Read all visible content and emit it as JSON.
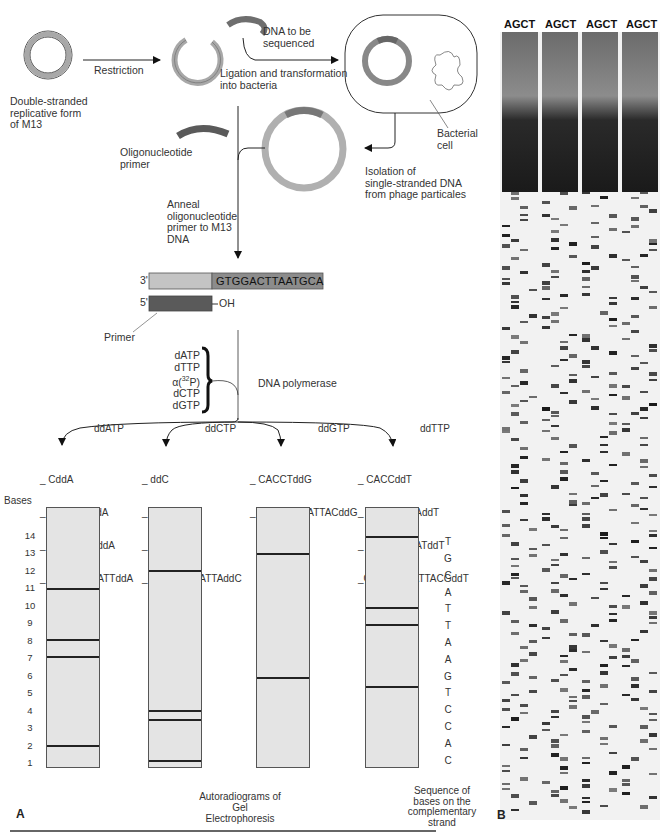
{
  "panel_a": {
    "label": "A",
    "step1": {
      "circle_label": "Double-stranded replicative form of M13",
      "circle_label_lines": [
        "Double-stranded",
        "replicative form",
        "of M13"
      ],
      "arrow_label": "Restriction"
    },
    "insert": {
      "label_lines": [
        "DNA to be",
        "sequenced"
      ]
    },
    "ligation": {
      "label_lines": [
        "Ligation and transformation",
        "into bacteria"
      ]
    },
    "bacterial_cell": {
      "label_lines": [
        "Bacterial",
        "cell"
      ]
    },
    "isolation": {
      "label_lines": [
        "Isolation of",
        "single-stranded DNA",
        "from phage particales"
      ]
    },
    "primer": {
      "label_lines": [
        "Oligonucleotide",
        "primer"
      ]
    },
    "anneal": {
      "label_lines": [
        "Anneal",
        "oligonucleotide",
        "primer to M13",
        "DNA"
      ]
    },
    "template": {
      "end_3": "3'",
      "end_5": "5'",
      "sequence": "GTGGACTTAATGCA",
      "oh": "OH",
      "primer_label": "Primer"
    },
    "reaction": {
      "nucleotides": [
        "dATP",
        "dTTP",
        "dCTP",
        "dGTP"
      ],
      "label_prefix": "α(",
      "label_isotope": "32",
      "label_suffix": "P)",
      "enzyme": "DNA polymerase"
    },
    "reactions": [
      {
        "dd": "ddATP",
        "fragments": [
          "CddA",
          "CACCTGddA",
          "CACCTGAddA",
          "CACCTGAATTddA"
        ]
      },
      {
        "dd": "ddCTP",
        "fragments": [
          "ddC",
          "CAddC",
          "CACddC",
          "CACCTGAATTAddC"
        ]
      },
      {
        "dd": "ddGTP",
        "fragments": [
          "CACCTddG",
          "CACCTGAATTACddG"
        ]
      },
      {
        "dd": "ddTTP",
        "fragments": [
          "CACCddT",
          "CACCTGAAddT",
          "CACCTGAATddT",
          "CACCTGAATTACGddT"
        ]
      }
    ],
    "gel": {
      "bases_label": "Bases",
      "base_numbers": [
        "14",
        "13",
        "12",
        "11",
        "10",
        "9",
        "8",
        "7",
        "6",
        "5",
        "4",
        "3",
        "2",
        "1"
      ],
      "complementary_sequence": [
        "T",
        "G",
        "C",
        "A",
        "T",
        "T",
        "A",
        "A",
        "G",
        "T",
        "C",
        "C",
        "A",
        "C"
      ],
      "caption_lines": [
        "Autoradiograms of Gel",
        "Electrophoresis"
      ],
      "sequence_caption_lines": [
        "Sequence of",
        "bases on the",
        "complementary",
        "strand"
      ],
      "lanes": [
        {
          "name": "A",
          "bands_at_base": [
            11,
            8,
            7,
            2
          ]
        },
        {
          "name": "C",
          "bands_at_base": [
            12,
            4,
            3.5,
            1
          ]
        },
        {
          "name": "G",
          "bands_at_base": [
            13,
            6
          ]
        },
        {
          "name": "T",
          "bands_at_base": [
            14,
            10,
            9,
            5
          ]
        }
      ]
    }
  },
  "panel_b": {
    "label": "B",
    "lane_group_headers": [
      "AGCT",
      "AGCT",
      "AGCT",
      "AGCT"
    ]
  },
  "colors": {
    "ring": "#a8a8a8",
    "insert": "#6e6e6e",
    "primer": "#5a5a5a",
    "lane_fill": "#e4e4e4",
    "band": "#222222"
  }
}
